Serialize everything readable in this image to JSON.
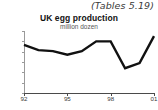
{
  "reference_note": "(Tables 5.19)",
  "chart_data": {
    "type": "line",
    "title": "UK  egg production",
    "subtitle": "million dozen",
    "xlabel": "",
    "ylabel": "",
    "units": "million dozen",
    "x": [
      1992,
      1993,
      1994,
      1995,
      1996,
      1997,
      1998,
      1999,
      2000,
      2001
    ],
    "categories": [
      "92",
      "93",
      "94",
      "95",
      "96",
      "97",
      "98",
      "99",
      "00",
      "01"
    ],
    "values": [
      893,
      883,
      881,
      874,
      881,
      900,
      900,
      848,
      858,
      910
    ],
    "series": [
      {
        "name": "UK egg production",
        "values": [
          893,
          883,
          881,
          874,
          881,
          900,
          900,
          848,
          858,
          910
        ],
        "color": "#111111"
      }
    ],
    "ylim": [
      800,
      920
    ],
    "xlim": [
      1992,
      2001
    ],
    "ytick_labels": [
      "920",
      "900",
      "880",
      "860",
      "840",
      "820",
      "800"
    ],
    "ytick_values": [
      920,
      900,
      880,
      860,
      840,
      820,
      800
    ],
    "xtick_labels": [
      "92",
      "95",
      "98",
      "01"
    ],
    "xtick_values": [
      1992,
      1995,
      1998,
      2001
    ],
    "grid": false,
    "legend": false,
    "line_color": "#111111",
    "axis_color": "#4a4a4a"
  }
}
